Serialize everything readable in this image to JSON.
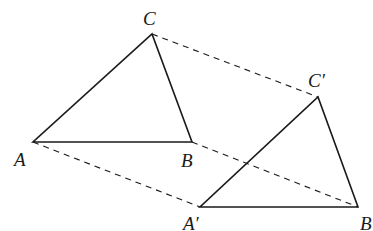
{
  "diagram": {
    "original_triangle": {
      "vertices": {
        "A": {
          "label": "A",
          "x": 33,
          "y": 142
        },
        "B": {
          "label": "B",
          "x": 192,
          "y": 142
        },
        "C": {
          "label": "C",
          "x": 152,
          "y": 34
        }
      }
    },
    "translated_triangle": {
      "vertices": {
        "A": {
          "label": "A′",
          "x": 200,
          "y": 207
        },
        "B": {
          "label": "B",
          "x": 358,
          "y": 207
        },
        "C": {
          "label": "C′",
          "x": 318,
          "y": 97
        }
      }
    },
    "connectors": [
      {
        "from": "C",
        "to": "C′",
        "style": "dashed"
      },
      {
        "from": "A",
        "to": "A′",
        "style": "dashed"
      },
      {
        "from": "B",
        "to": "B′",
        "style": "dashed"
      }
    ],
    "colors": {
      "line": "#1a1a1a",
      "background": "#ffffff"
    }
  }
}
